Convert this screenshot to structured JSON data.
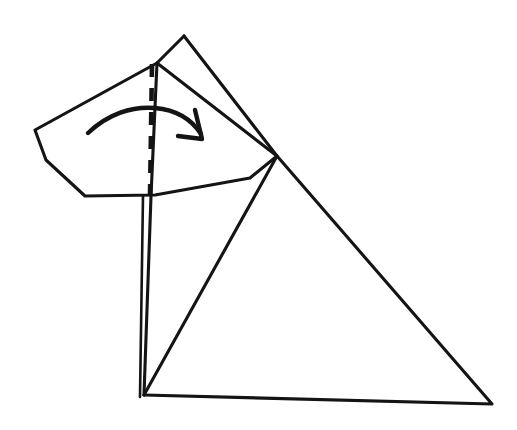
{
  "document": {
    "title": "Hand-drawn paper folding diagram",
    "description": "Sketch of a large triangle with a pentagonal flap folded over it, a dashed vertical fold line and a curved arrow indicating the fold direction",
    "background_color": "#ffffff",
    "ink_color": "#141414",
    "width": 517,
    "height": 430
  },
  "figure": {
    "shapes": [
      {
        "name": "large-triangle",
        "kind": "polyline",
        "style": "solid",
        "stroke_width": 3.1,
        "points": "184,36 277,156 492,404 144,395"
      },
      {
        "name": "triangle-left-edge",
        "kind": "polyline",
        "style": "solid",
        "stroke_width": 3.1,
        "points": "144,395 151,196 157,63 184,36"
      },
      {
        "name": "pentagon-flap",
        "kind": "polyline",
        "style": "solid",
        "stroke_width": 3.1,
        "points": "157,63 35,130 46,160 85,196 155,195 250,178 277,156 157,63"
      },
      {
        "name": "interior-diagonal",
        "kind": "polyline",
        "style": "solid",
        "stroke_width": 3.1,
        "points": "277,156 144,395"
      },
      {
        "name": "left-upright-line",
        "kind": "polyline",
        "style": "thin",
        "stroke_width": 2.6,
        "points": "143,196 140,397"
      },
      {
        "name": "fold-line-dashed",
        "kind": "polyline",
        "style": "dashed",
        "stroke_width": 4.6,
        "points": "152,64 150,196"
      },
      {
        "name": "fold-arc-arrow",
        "kind": "path",
        "style": "arrow",
        "stroke_width": 4.4,
        "d": "M 88,133 C 108,114 132,106 155,108 C 177,110 192,120 201,134"
      },
      {
        "name": "arrowhead",
        "kind": "path",
        "style": "arrow",
        "stroke_width": 4.4,
        "d": "M 195,110 L 202,139 L 178,136"
      }
    ],
    "annotations": {
      "apex_label": "",
      "fold_direction": "clockwise over the dashed crease"
    }
  }
}
